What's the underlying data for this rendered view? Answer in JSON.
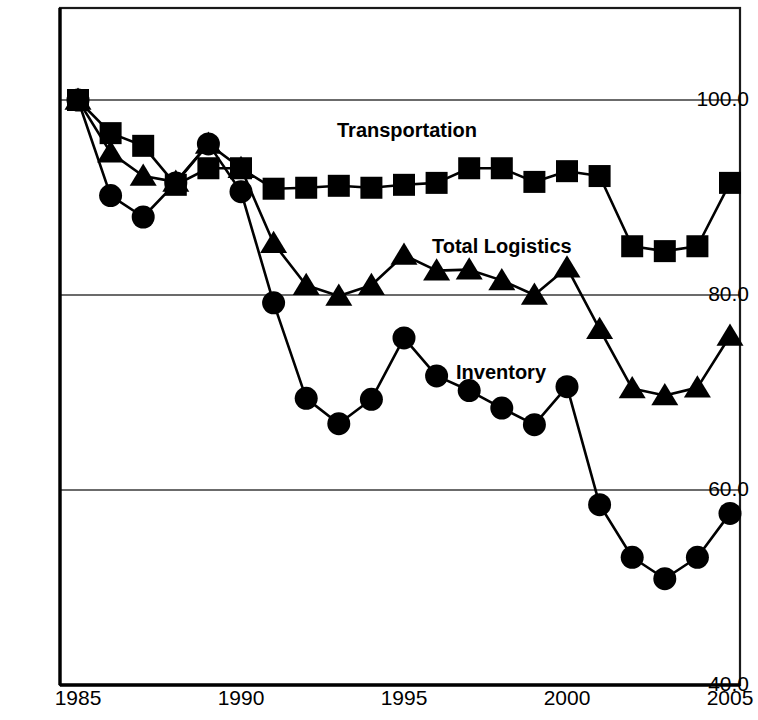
{
  "chart_data": {
    "type": "line",
    "title": "",
    "subtitle": "",
    "xlabel": "",
    "ylabel": "",
    "xlim": [
      1985,
      2005
    ],
    "ylim": [
      40.0,
      105.0
    ],
    "grid": "horizontal",
    "legend_position": "inline-annotations",
    "x": [
      1985,
      1986,
      1987,
      1988,
      1989,
      1990,
      1991,
      1992,
      1993,
      1994,
      1995,
      1996,
      1997,
      1998,
      1999,
      2000,
      2001,
      2002,
      2003,
      2004,
      2005
    ],
    "y_ticks": [
      40.0,
      60.0,
      80.0,
      100.0
    ],
    "y_tick_labels": [
      "40.0",
      "60.0",
      "80.0",
      "100.0"
    ],
    "x_ticks": [
      1985,
      1990,
      1995,
      2000,
      2005
    ],
    "x_tick_labels": [
      "1985",
      "1990",
      "1995",
      "2000",
      "2005"
    ],
    "series": [
      {
        "name": "Transportation",
        "marker": "square",
        "color": "#000000",
        "label_x": 1992.6,
        "label_y": 98.0,
        "values": [
          100.0,
          96.6,
          95.3,
          91.3,
          93.0,
          93.0,
          90.9,
          91.0,
          91.2,
          91.0,
          91.3,
          91.5,
          93.0,
          93.0,
          91.6,
          92.7,
          92.2,
          85.0,
          84.5,
          85.0,
          91.5
        ]
      },
      {
        "name": "Total Logistics",
        "marker": "triangle",
        "color": "#000000",
        "label_x": 1995.8,
        "label_y": 85.5,
        "values": [
          100.0,
          94.6,
          92.2,
          91.6,
          95.5,
          93.0,
          85.3,
          81.0,
          79.9,
          81.0,
          84.1,
          82.5,
          82.6,
          81.5,
          80.0,
          82.8,
          76.5,
          70.4,
          69.7,
          70.5,
          75.8
        ]
      },
      {
        "name": "Inventory",
        "marker": "circle",
        "color": "#000000",
        "label_x": 1995.9,
        "label_y": 72.2,
        "values": [
          100.0,
          90.2,
          88.0,
          91.5,
          95.5,
          90.6,
          79.2,
          69.4,
          66.8,
          69.3,
          75.6,
          71.7,
          70.2,
          68.4,
          66.7,
          70.6,
          58.5,
          53.1,
          50.9,
          53.1,
          57.6
        ]
      }
    ]
  },
  "axes": {
    "y_labels": [
      "100.0",
      "80.0",
      "60.0",
      "40.0"
    ],
    "x_labels": [
      "1985",
      "1990",
      "1995",
      "2000",
      "2005"
    ]
  },
  "annotations": {
    "transportation": "Transportation",
    "total_logistics": "Total Logistics",
    "inventory": "Inventory"
  }
}
